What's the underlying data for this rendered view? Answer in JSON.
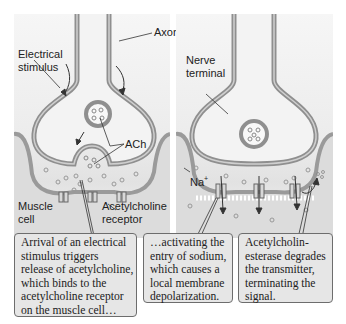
{
  "labels": {
    "axon": "Axon",
    "electrical_stimulus": "Electrical\nstimulus",
    "ach": "ACh",
    "muscle_cell": "Muscle\ncell",
    "ach_receptor": "Acetylcholine\nreceptor",
    "nerve_terminal": "Nerve\nterminal",
    "sodium": "Na",
    "sodium_charge": "+"
  },
  "captions": [
    {
      "text": "Arrival of an electrical\nstimulus triggers\nrelease of acetylcholine,\nwhich binds to the\nacetylcholine receptor\non the muscle cell…"
    },
    {
      "text": "…activating the\nentry of sodium,\nwhich causes a\nlocal membrane\ndepolarization."
    },
    {
      "text": "Acetylcholin-\nesterase degrades\nthe transmitter,\nterminating the\nsignal."
    }
  ],
  "colors": {
    "membrane": "#8f8f8f",
    "membrane_inner": "#c8c8c8",
    "background": "#ececec",
    "caption_bg": "#e6e6e6",
    "caption_border": "#6d6d6d"
  }
}
